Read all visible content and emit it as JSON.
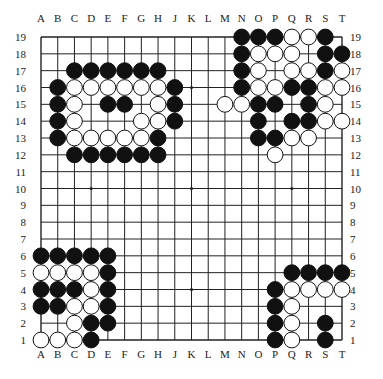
{
  "board": {
    "size": 19,
    "columns": [
      "A",
      "B",
      "C",
      "D",
      "E",
      "F",
      "G",
      "H",
      "J",
      "K",
      "L",
      "M",
      "N",
      "O",
      "P",
      "Q",
      "R",
      "S",
      "T"
    ],
    "rows": [
      "19",
      "18",
      "17",
      "16",
      "15",
      "14",
      "13",
      "12",
      "11",
      "10",
      "9",
      "8",
      "7",
      "6",
      "5",
      "4",
      "3",
      "2",
      "1"
    ],
    "star_points": [
      "D16",
      "K16",
      "Q16",
      "D10",
      "K10",
      "Q10",
      "D4",
      "K4",
      "Q4"
    ],
    "colors": {
      "black": "#111111",
      "white": "#ffffff",
      "line": "#222222"
    },
    "stones": {
      "black": [
        "C17",
        "D17",
        "E17",
        "F17",
        "G17",
        "H17",
        "B16",
        "J16",
        "B15",
        "E15",
        "F15",
        "J15",
        "B14",
        "J14",
        "B13",
        "H13",
        "C12",
        "D12",
        "E12",
        "F12",
        "G12",
        "H12",
        "N19",
        "O19",
        "P19",
        "S19",
        "N18",
        "S18",
        "T18",
        "N17",
        "S17",
        "N16",
        "Q16",
        "R16",
        "O15",
        "P15",
        "R15",
        "O14",
        "Q14",
        "R14",
        "O13",
        "P13",
        "A6",
        "B6",
        "C6",
        "D6",
        "E6",
        "E5",
        "A4",
        "B4",
        "C4",
        "E4",
        "A3",
        "B3",
        "E3",
        "D2",
        "E2",
        "D1",
        "Q5",
        "R5",
        "S5",
        "T5",
        "P4",
        "P3",
        "P2",
        "S2",
        "P1",
        "S1"
      ],
      "white": [
        "C16",
        "D16",
        "E16",
        "F16",
        "G16",
        "H16",
        "C15",
        "H15",
        "C14",
        "G14",
        "H14",
        "C13",
        "D13",
        "E13",
        "F13",
        "G13",
        "Q19",
        "R19",
        "O18",
        "P18",
        "Q18",
        "O17",
        "Q17",
        "R17",
        "T17",
        "O16",
        "P16",
        "S16",
        "T16",
        "M15",
        "N15",
        "S15",
        "S14",
        "T14",
        "Q13",
        "R13",
        "P12",
        "A5",
        "B5",
        "C5",
        "D5",
        "D4",
        "C3",
        "D3",
        "C2",
        "A1",
        "B1",
        "C1",
        "Q4",
        "R4",
        "S4",
        "T4",
        "Q3",
        "Q2",
        "Q1"
      ]
    }
  }
}
